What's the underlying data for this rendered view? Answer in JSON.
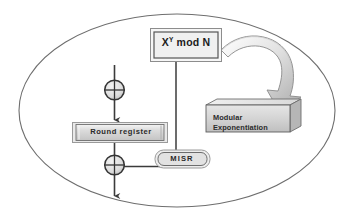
{
  "diagram": {
    "boundary": {
      "shape_name": "ellipse-boundary",
      "stroke": "#6e6e6e"
    },
    "nodes": {
      "xymodn": {
        "label_base": "X",
        "label_sup": "Y",
        "label_rest": " mod N",
        "label_full": "Xᵧ mod N",
        "shape": "double-rectangle",
        "fill": "#f2f2f2",
        "stroke": "#707070"
      },
      "round_register": {
        "label": "Round register",
        "shape": "rectangle-3d-shaded",
        "fill": "#d8d8d8",
        "stroke": "#6f6f6f"
      },
      "modular_exponentiation": {
        "label_line1": "Modular",
        "label_line2": "Exponentiation",
        "shape": "cube-3d",
        "fill": "#d5d5d5",
        "stroke": "#5e5e5e"
      },
      "misr": {
        "label": "MISR",
        "shape": "rounded-rectangle",
        "fill": "#ebebeb",
        "stroke": "#5f5f5f"
      },
      "xor_top": {
        "label": "XOR",
        "shape": "circle-with-cross",
        "fill": "#e6e6e6",
        "stroke": "#3a3a3a"
      },
      "xor_bottom": {
        "label": "XOR",
        "shape": "circle-with-cross",
        "fill": "#e6e6e6",
        "stroke": "#3a3a3a"
      }
    },
    "connectors": [
      {
        "name": "input-to-xor-top",
        "from": "input",
        "to": "xor_top",
        "type": "arrow-down"
      },
      {
        "name": "xor-top-to-round-register",
        "from": "xor_top",
        "to": "round_register",
        "type": "arrow-down"
      },
      {
        "name": "round-register-to-xor-bottom",
        "from": "round_register",
        "to": "xor_bottom",
        "type": "arrow-down"
      },
      {
        "name": "xor-bottom-to-output",
        "from": "xor_bottom",
        "to": "output",
        "type": "arrow-down"
      },
      {
        "name": "xor-bottom-to-misr",
        "from": "xor_bottom",
        "to": "misr",
        "type": "arrow-up-elbow"
      },
      {
        "name": "xymodn-to-misr",
        "from": "xymodn",
        "to": "misr",
        "type": "line-vertical"
      },
      {
        "name": "xymodn-to-modular-exponentiation",
        "from": "xymodn",
        "to": "modular_exponentiation",
        "type": "curved-block-arrow"
      }
    ]
  }
}
